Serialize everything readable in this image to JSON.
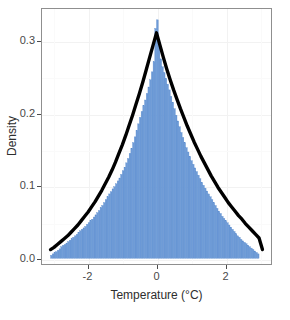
{
  "chart_data": {
    "type": "bar",
    "title": "",
    "subtitle": "",
    "xlabel": "Temperature (°C)",
    "ylabel": "Density",
    "xlim": [
      -3.35,
      3.35
    ],
    "ylim": [
      -0.008,
      0.345
    ],
    "xticks": [
      -2,
      0,
      2
    ],
    "xtick_labels": [
      "-2",
      "0",
      "2"
    ],
    "yticks": [
      0.0,
      0.1,
      0.2,
      0.3
    ],
    "ytick_labels": [
      "0.0",
      "0.1",
      "0.2",
      "0.3"
    ],
    "grid": true,
    "legend": null,
    "bar_color": "#6e9bd7",
    "curve_color": "#000000",
    "panel_border_color": "#8f8f8f",
    "grid_color": "#f2f2f2",
    "background": "#ffffff",
    "bin_width": 0.05,
    "histogram": {
      "name": "Temperature histogram (density)",
      "bin_centers": [
        -3.075,
        -3.025,
        -2.975,
        -2.925,
        -2.875,
        -2.825,
        -2.775,
        -2.725,
        -2.675,
        -2.625,
        -2.575,
        -2.525,
        -2.475,
        -2.425,
        -2.375,
        -2.325,
        -2.275,
        -2.225,
        -2.175,
        -2.125,
        -2.075,
        -2.025,
        -1.975,
        -1.925,
        -1.875,
        -1.825,
        -1.775,
        -1.725,
        -1.675,
        -1.625,
        -1.575,
        -1.525,
        -1.475,
        -1.425,
        -1.375,
        -1.325,
        -1.275,
        -1.225,
        -1.175,
        -1.125,
        -1.075,
        -1.025,
        -0.975,
        -0.925,
        -0.875,
        -0.825,
        -0.775,
        -0.725,
        -0.675,
        -0.625,
        -0.575,
        -0.525,
        -0.475,
        -0.425,
        -0.375,
        -0.325,
        -0.275,
        -0.225,
        -0.175,
        -0.125,
        -0.075,
        -0.025,
        0.025,
        0.075,
        0.125,
        0.175,
        0.225,
        0.275,
        0.325,
        0.375,
        0.425,
        0.475,
        0.525,
        0.575,
        0.625,
        0.675,
        0.725,
        0.775,
        0.825,
        0.875,
        0.925,
        0.975,
        1.025,
        1.075,
        1.125,
        1.175,
        1.225,
        1.275,
        1.325,
        1.375,
        1.425,
        1.475,
        1.525,
        1.575,
        1.625,
        1.675,
        1.725,
        1.775,
        1.825,
        1.875,
        1.925,
        1.975,
        2.025,
        2.075,
        2.125,
        2.175,
        2.225,
        2.275,
        2.325,
        2.375,
        2.425,
        2.475,
        2.525,
        2.575,
        2.625,
        2.675,
        2.725,
        2.775,
        2.825,
        2.875,
        2.925,
        2.975,
        3.025,
        3.075
      ],
      "values": [
        0.004,
        0.006,
        0.008,
        0.009,
        0.011,
        0.013,
        0.016,
        0.018,
        0.019,
        0.021,
        0.023,
        0.025,
        0.027,
        0.029,
        0.031,
        0.033,
        0.036,
        0.038,
        0.04,
        0.042,
        0.044,
        0.047,
        0.049,
        0.052,
        0.054,
        0.057,
        0.06,
        0.063,
        0.066,
        0.07,
        0.073,
        0.077,
        0.081,
        0.085,
        0.089,
        0.092,
        0.096,
        0.099,
        0.103,
        0.107,
        0.111,
        0.116,
        0.121,
        0.126,
        0.132,
        0.138,
        0.145,
        0.152,
        0.16,
        0.168,
        0.177,
        0.186,
        0.195,
        0.203,
        0.211,
        0.219,
        0.228,
        0.237,
        0.247,
        0.258,
        0.272,
        0.318,
        0.33,
        0.302,
        0.276,
        0.265,
        0.257,
        0.249,
        0.241,
        0.233,
        0.224,
        0.216,
        0.207,
        0.198,
        0.19,
        0.182,
        0.174,
        0.167,
        0.16,
        0.153,
        0.147,
        0.141,
        0.135,
        0.13,
        0.125,
        0.12,
        0.115,
        0.11,
        0.105,
        0.101,
        0.097,
        0.093,
        0.089,
        0.085,
        0.081,
        0.077,
        0.073,
        0.069,
        0.065,
        0.062,
        0.058,
        0.055,
        0.052,
        0.049,
        0.046,
        0.043,
        0.04,
        0.037,
        0.034,
        0.031,
        0.029,
        0.026,
        0.024,
        0.022,
        0.02,
        0.018,
        0.016,
        0.014,
        0.012,
        0.01,
        0.008,
        0.006
      ]
    },
    "density_curve": {
      "name": "Fitted density curve",
      "peak_x": 0.0,
      "peak_y": 0.312,
      "x": [
        -3.1,
        -3.0,
        -2.9,
        -2.8,
        -2.7,
        -2.6,
        -2.5,
        -2.4,
        -2.3,
        -2.2,
        -2.1,
        -2.0,
        -1.9,
        -1.8,
        -1.7,
        -1.6,
        -1.5,
        -1.4,
        -1.3,
        -1.2,
        -1.1,
        -1.0,
        -0.9,
        -0.8,
        -0.7,
        -0.6,
        -0.5,
        -0.4,
        -0.3,
        -0.2,
        -0.1,
        0.0,
        0.1,
        0.2,
        0.3,
        0.4,
        0.5,
        0.6,
        0.7,
        0.8,
        0.9,
        1.0,
        1.1,
        1.2,
        1.3,
        1.4,
        1.5,
        1.6,
        1.7,
        1.8,
        1.9,
        2.0,
        2.1,
        2.2,
        2.3,
        2.4,
        2.5,
        2.6,
        2.7,
        2.8,
        2.9,
        3.0,
        3.1
      ],
      "y": [
        0.012,
        0.015,
        0.019,
        0.023,
        0.027,
        0.031,
        0.036,
        0.041,
        0.046,
        0.052,
        0.058,
        0.064,
        0.071,
        0.078,
        0.086,
        0.094,
        0.103,
        0.112,
        0.122,
        0.133,
        0.145,
        0.157,
        0.17,
        0.184,
        0.198,
        0.213,
        0.228,
        0.244,
        0.261,
        0.278,
        0.295,
        0.312,
        0.295,
        0.278,
        0.262,
        0.247,
        0.233,
        0.22,
        0.207,
        0.195,
        0.183,
        0.172,
        0.161,
        0.151,
        0.141,
        0.132,
        0.123,
        0.114,
        0.106,
        0.098,
        0.091,
        0.084,
        0.077,
        0.071,
        0.065,
        0.059,
        0.054,
        0.048,
        0.043,
        0.038,
        0.033,
        0.028,
        0.012
      ]
    }
  }
}
